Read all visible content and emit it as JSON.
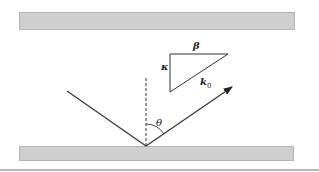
{
  "diagram": {
    "type": "reflection-geometry",
    "labels": {
      "beta": "β",
      "kappa": "κ",
      "k0_main": "k",
      "k0_sub": "0",
      "theta": "θ"
    },
    "colors": {
      "line": "#333333",
      "plate_fill": "#cfcfcf",
      "plate_border": "#b4b4b4"
    }
  }
}
